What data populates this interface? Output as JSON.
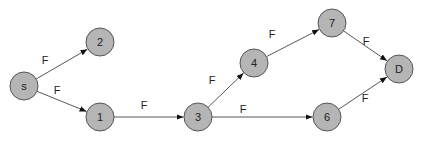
{
  "graph": {
    "node_fill": "#b5b5b5",
    "node_stroke": "#555555",
    "node_radius": 14,
    "nodes": [
      {
        "id": "s",
        "label": "s",
        "x": 24,
        "y": 86
      },
      {
        "id": "2",
        "label": "2",
        "x": 100,
        "y": 42
      },
      {
        "id": "1",
        "label": "1",
        "x": 100,
        "y": 117
      },
      {
        "id": "3",
        "label": "3",
        "x": 198,
        "y": 117
      },
      {
        "id": "4",
        "label": "4",
        "x": 254,
        "y": 63
      },
      {
        "id": "7",
        "label": "7",
        "x": 332,
        "y": 23
      },
      {
        "id": "6",
        "label": "6",
        "x": 327,
        "y": 117
      },
      {
        "id": "D",
        "label": "D",
        "x": 399,
        "y": 69
      }
    ],
    "edges": [
      {
        "from": "s",
        "to": "2",
        "label": "F",
        "lx": 45,
        "ly": 60
      },
      {
        "from": "s",
        "to": "1",
        "label": "F",
        "lx": 57,
        "ly": 90
      },
      {
        "from": "1",
        "to": "3",
        "label": "F",
        "lx": 144,
        "ly": 105
      },
      {
        "from": "3",
        "to": "4",
        "label": "F",
        "lx": 212,
        "ly": 80
      },
      {
        "from": "4",
        "to": "7",
        "label": "F",
        "lx": 272,
        "ly": 34
      },
      {
        "from": "7",
        "to": "D",
        "label": "F",
        "lx": 366,
        "ly": 41
      },
      {
        "from": "3",
        "to": "6",
        "label": "F",
        "lx": 243,
        "ly": 109
      },
      {
        "from": "6",
        "to": "D",
        "label": "F",
        "lx": 365,
        "ly": 98
      }
    ]
  }
}
